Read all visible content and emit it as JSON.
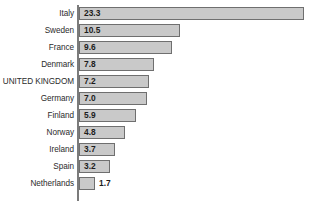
{
  "chart_data": {
    "type": "bar",
    "orientation": "horizontal",
    "title": "",
    "subtitle": "",
    "xlabel": "",
    "ylabel": "",
    "grid": false,
    "legend": null,
    "legend_position": "none",
    "xlim": [
      0,
      23.3
    ],
    "axis_line": "left-vertical",
    "value_labels": true,
    "highlighted_category": "UNITED KINGDOM",
    "categories": [
      "Italy",
      "Sweden",
      "France",
      "Denmark",
      "UNITED KINGDOM",
      "Germany",
      "Finland",
      "Norway",
      "Ireland",
      "Spain",
      "Netherlands"
    ],
    "values": [
      23.3,
      10.5,
      9.6,
      7.8,
      7.2,
      7.0,
      5.9,
      4.8,
      3.7,
      3.2,
      1.7
    ],
    "value_labels_text": [
      "23.3",
      "10.5",
      "9.6",
      "7.8",
      "7.2",
      "7.0",
      "5.9",
      "4.8",
      "3.7",
      "3.2",
      "1.7"
    ],
    "label_placement": [
      "inside",
      "inside",
      "inside",
      "inside",
      "inside",
      "inside",
      "inside",
      "inside",
      "inside",
      "inside",
      "outside"
    ],
    "colors": {
      "bar_fill": "#c9c9c9",
      "bar_border": "#6f6f6f",
      "axis": "#7b7b7b",
      "label_text": "#2b2b2b",
      "value_text": "#1c1c1c",
      "background": "#ffffff"
    }
  },
  "rows": [
    {
      "label": "Italy",
      "value": "23.3",
      "bar_px": 225,
      "placement": "inside"
    },
    {
      "label": "Sweden",
      "value": "10.5",
      "bar_px": 101,
      "placement": "inside"
    },
    {
      "label": "France",
      "value": "9.6",
      "bar_px": 93,
      "placement": "inside"
    },
    {
      "label": "Denmark",
      "value": "7.8",
      "bar_px": 75,
      "placement": "inside"
    },
    {
      "label": "UNITED KINGDOM",
      "value": "7.2",
      "bar_px": 70,
      "placement": "inside"
    },
    {
      "label": "Germany",
      "value": "7.0",
      "bar_px": 68,
      "placement": "inside"
    },
    {
      "label": "Finland",
      "value": "5.9",
      "bar_px": 57,
      "placement": "inside"
    },
    {
      "label": "Norway",
      "value": "4.8",
      "bar_px": 46,
      "placement": "inside"
    },
    {
      "label": "Ireland",
      "value": "3.7",
      "bar_px": 36,
      "placement": "inside"
    },
    {
      "label": "Spain",
      "value": "3.2",
      "bar_px": 31,
      "placement": "inside"
    },
    {
      "label": "Netherlands",
      "value": "1.7",
      "bar_px": 16,
      "placement": "outside"
    }
  ]
}
